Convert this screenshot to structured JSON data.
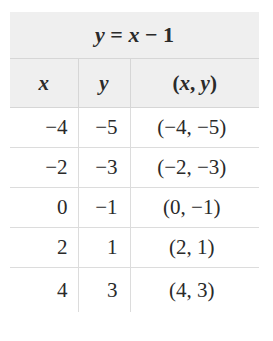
{
  "table": {
    "title": {
      "lhs": "y",
      "eq": " = ",
      "var": "x",
      "rest": " − 1",
      "full": "y = x − 1"
    },
    "columns": [
      {
        "label": "x"
      },
      {
        "label": "y"
      },
      {
        "label": "(x, y)",
        "open": "(",
        "a": "x",
        "sep": ", ",
        "b": "y",
        "close": ")"
      }
    ],
    "rows": [
      {
        "x": "−4",
        "y": "−5",
        "point": "(−4, −5)"
      },
      {
        "x": "−2",
        "y": "−3",
        "point": "(−2, −3)"
      },
      {
        "x": "0",
        "y": "−1",
        "point": "(0, −1)"
      },
      {
        "x": "2",
        "y": "1",
        "point": "(2, 1)"
      },
      {
        "x": "4",
        "y": "3",
        "point": "(4, 3)"
      }
    ]
  },
  "colors": {
    "header_bg": "#efefef",
    "grid": "#d6d6d6",
    "text": "#2a2a2a"
  }
}
